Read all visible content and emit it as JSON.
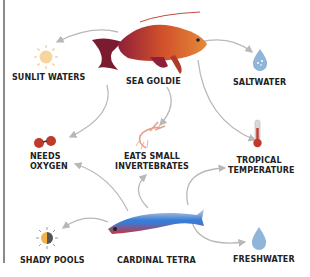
{
  "diagram": {
    "nodes": [
      {
        "id": "sunlit_waters",
        "label": "SUNLIT WATERS",
        "icon": "sun-icon"
      },
      {
        "id": "sea_goldie",
        "label": "SEA GOLDIE",
        "icon": "sea-goldie-fish"
      },
      {
        "id": "saltwater",
        "label": "SALTWATER",
        "icon": "water-drop-icon"
      },
      {
        "id": "needs_oxygen",
        "label_line1": "NEEDS",
        "label_line2": "OXYGEN",
        "icon": "oxygen-molecule-icon"
      },
      {
        "id": "eats_small_invertebrates",
        "label_line1": "EATS SMALL",
        "label_line2": "INVERTEBRATES",
        "icon": "shrimp-icon"
      },
      {
        "id": "tropical_temperature",
        "label_line1": "TROPICAL",
        "label_line2": "TEMPERATURE",
        "icon": "thermometer-icon"
      },
      {
        "id": "shady_pools",
        "label": "SHADY POOLS",
        "icon": "half-sun-icon"
      },
      {
        "id": "cardinal_tetra",
        "label": "CARDINAL TETRA",
        "icon": "cardinal-tetra-fish"
      },
      {
        "id": "freshwater",
        "label": "FRESHWATER",
        "icon": "water-drop-icon"
      }
    ],
    "edges": [
      {
        "from": "sea_goldie",
        "to": "sunlit_waters"
      },
      {
        "from": "sea_goldie",
        "to": "saltwater"
      },
      {
        "from": "sea_goldie",
        "to": "eats_small_invertebrates"
      },
      {
        "from": "sea_goldie",
        "to": "tropical_temperature"
      },
      {
        "from": "sunlit_waters",
        "to": "needs_oxygen"
      },
      {
        "from": "cardinal_tetra",
        "to": "needs_oxygen"
      },
      {
        "from": "cardinal_tetra",
        "to": "eats_small_invertebrates"
      },
      {
        "from": "cardinal_tetra",
        "to": "tropical_temperature"
      },
      {
        "from": "cardinal_tetra",
        "to": "shady_pools"
      },
      {
        "from": "cardinal_tetra",
        "to": "freshwater"
      }
    ]
  },
  "colors": {
    "arrow": "#b8b8b8",
    "goldie_body": "#d2502a",
    "tetra_stripe": "#3a7bd5",
    "sun": "#f3b24a",
    "drop": "#8fb6d9",
    "oxygen": "#c0392b",
    "thermometer": "#c0392b"
  }
}
